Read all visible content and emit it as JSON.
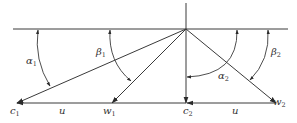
{
  "diagram": {
    "title": "",
    "colors": {
      "line": "#3a3a3a",
      "text": "#333333",
      "background": "#ffffff"
    },
    "labels": {
      "c1": {
        "base": "c",
        "sub": "1"
      },
      "w1": {
        "base": "w",
        "sub": "1"
      },
      "c2": {
        "base": "c",
        "sub": "2"
      },
      "w2": {
        "base": "w",
        "sub": "2"
      },
      "u_left": {
        "base": "u"
      },
      "u_right": {
        "base": "u"
      },
      "alpha1": {
        "base": "α",
        "sub": "1"
      },
      "beta1": {
        "base": "β",
        "sub": "1"
      },
      "alpha2": {
        "base": "α",
        "sub": "2"
      },
      "beta2": {
        "base": "β",
        "sub": "2"
      }
    }
  }
}
